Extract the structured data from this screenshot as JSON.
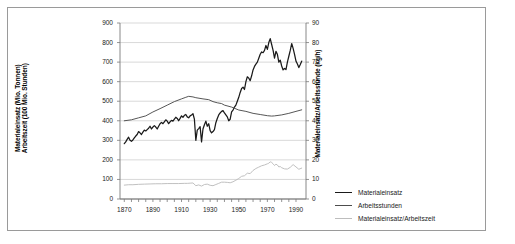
{
  "chart_data": {
    "type": "line",
    "title": "",
    "xlabel": "",
    "ylabel_left": "Materialeinsatz (Mio. Tonnen)\nArbeitszeit (100 Mio. Stunden)",
    "ylabel_left_line1": "Materialeinsatz (Mio. Tonnen)",
    "ylabel_left_line2": "Arbeitszeit (100 Mio. Stunden)",
    "ylabel_right": "Materialeinsatz/Arbeitsstunde (kg/h)",
    "xlim": [
      1867,
      1997
    ],
    "ylim_left": [
      0,
      900
    ],
    "ylim_right": [
      0,
      90
    ],
    "ytick_left": [
      0,
      100,
      200,
      300,
      400,
      500,
      600,
      700,
      800,
      900
    ],
    "ytick_right": [
      0,
      10,
      20,
      30,
      40,
      50,
      60,
      70,
      80,
      90
    ],
    "xticks": [
      1870,
      1890,
      1910,
      1930,
      1950,
      1970,
      1990
    ],
    "grid": "horizontal",
    "legend_position": "right",
    "colors": {
      "materialeinsatz": "#1a1a1a",
      "arbeitsstunden": "#4d4d4d",
      "ratio": "#bdbdbd",
      "grid": "#c8c8c8",
      "axis": "#7a7a7a",
      "frame": "#9a9a9a"
    },
    "legend": [
      {
        "label": "Materialeinsatz",
        "color": "#1a1a1a",
        "width": 1.5
      },
      {
        "label": "Arbeitsstunden",
        "color": "#4d4d4d",
        "width": 1.1
      },
      {
        "label": "Materialeinsatz/Arbeitszeit",
        "color": "#bdbdbd",
        "width": 1.1
      }
    ],
    "series": [
      {
        "name": "Materialeinsatz",
        "axis": "left",
        "unit": "Mio. Tonnen",
        "x": [
          1870,
          1871,
          1872,
          1873,
          1874,
          1875,
          1876,
          1877,
          1878,
          1879,
          1880,
          1881,
          1882,
          1883,
          1884,
          1885,
          1886,
          1887,
          1888,
          1889,
          1890,
          1891,
          1892,
          1893,
          1894,
          1895,
          1896,
          1897,
          1898,
          1899,
          1900,
          1901,
          1902,
          1903,
          1904,
          1905,
          1906,
          1907,
          1908,
          1909,
          1910,
          1911,
          1912,
          1913,
          1914,
          1915,
          1916,
          1917,
          1918,
          1919,
          1920,
          1921,
          1922,
          1923,
          1924,
          1925,
          1926,
          1927,
          1928,
          1929,
          1930,
          1931,
          1932,
          1933,
          1934,
          1935,
          1936,
          1937,
          1938,
          1939,
          1940,
          1941,
          1942,
          1943,
          1944,
          1945,
          1946,
          1947,
          1948,
          1949,
          1950,
          1951,
          1952,
          1953,
          1954,
          1955,
          1956,
          1957,
          1958,
          1959,
          1960,
          1961,
          1962,
          1963,
          1964,
          1965,
          1966,
          1967,
          1968,
          1969,
          1970,
          1971,
          1972,
          1973,
          1974,
          1975,
          1976,
          1977,
          1978,
          1979,
          1980,
          1981,
          1982,
          1983,
          1984,
          1985,
          1986,
          1987,
          1988,
          1989,
          1990,
          1991,
          1992,
          1993,
          1994
        ],
        "values": [
          283,
          292,
          305,
          316,
          300,
          295,
          302,
          312,
          322,
          330,
          345,
          338,
          330,
          342,
          352,
          348,
          355,
          362,
          372,
          358,
          368,
          375,
          368,
          358,
          372,
          385,
          392,
          385,
          395,
          405,
          398,
          385,
          395,
          402,
          398,
          408,
          418,
          412,
          400,
          412,
          425,
          418,
          428,
          432,
          420,
          415,
          425,
          430,
          436,
          408,
          300,
          352,
          360,
          370,
          292,
          358,
          380,
          398,
          372,
          385,
          350,
          338,
          345,
          355,
          390,
          412,
          430,
          440,
          448,
          452,
          440,
          430,
          420,
          400,
          408,
          445,
          455,
          470,
          480,
          500,
          520,
          545,
          565,
          572,
          560,
          600,
          625,
          618,
          605,
          630,
          660,
          678,
          690,
          700,
          720,
          740,
          752,
          748,
          760,
          785,
          765,
          800,
          820,
          790,
          760,
          720,
          755,
          740,
          700,
          710,
          680,
          660,
          668,
          662,
          700,
          730,
          760,
          795,
          770,
          740,
          705,
          690,
          672,
          688,
          705
        ]
      },
      {
        "name": "Arbeitsstunden",
        "axis": "left",
        "unit": "100 Mio. Stunden",
        "x": [
          1870,
          1875,
          1880,
          1885,
          1890,
          1895,
          1900,
          1905,
          1910,
          1913,
          1915,
          1918,
          1920,
          1925,
          1929,
          1932,
          1935,
          1938,
          1940,
          1945,
          1950,
          1955,
          1960,
          1965,
          1970,
          1973,
          1975,
          1980,
          1985,
          1990,
          1994
        ],
        "values": [
          400,
          405,
          415,
          425,
          445,
          462,
          480,
          498,
          512,
          520,
          525,
          522,
          518,
          512,
          508,
          498,
          492,
          488,
          480,
          470,
          455,
          448,
          438,
          432,
          426,
          424,
          425,
          430,
          438,
          448,
          456
        ]
      },
      {
        "name": "Materialeinsatz/Arbeitszeit",
        "axis": "right",
        "unit": "kg/h",
        "x": [
          1870,
          1873,
          1876,
          1880,
          1884,
          1888,
          1892,
          1896,
          1900,
          1904,
          1908,
          1912,
          1914,
          1916,
          1918,
          1920,
          1922,
          1924,
          1926,
          1928,
          1930,
          1932,
          1934,
          1936,
          1938,
          1940,
          1942,
          1944,
          1946,
          1948,
          1950,
          1952,
          1954,
          1956,
          1958,
          1960,
          1962,
          1964,
          1966,
          1968,
          1970,
          1971,
          1972,
          1973,
          1974,
          1975,
          1976,
          1977,
          1978,
          1979,
          1980,
          1982,
          1984,
          1986,
          1988,
          1990,
          1992,
          1994
        ],
        "values": [
          7.1,
          7.3,
          7.3,
          7.5,
          7.6,
          7.7,
          7.8,
          7.8,
          7.9,
          7.9,
          7.9,
          8.0,
          8.0,
          8.1,
          8.2,
          6.8,
          7.2,
          6.6,
          7.4,
          7.6,
          7.0,
          6.8,
          7.4,
          8.0,
          8.6,
          8.6,
          8.5,
          8.3,
          8.8,
          9.6,
          10.5,
          11.6,
          11.9,
          13.2,
          13.0,
          14.6,
          15.6,
          16.3,
          17.0,
          17.4,
          18.0,
          18.3,
          19.0,
          18.7,
          18.0,
          17.1,
          17.8,
          17.4,
          16.4,
          16.6,
          16.0,
          15.4,
          15.3,
          16.2,
          17.6,
          16.4,
          15.2,
          15.8
        ]
      }
    ]
  }
}
